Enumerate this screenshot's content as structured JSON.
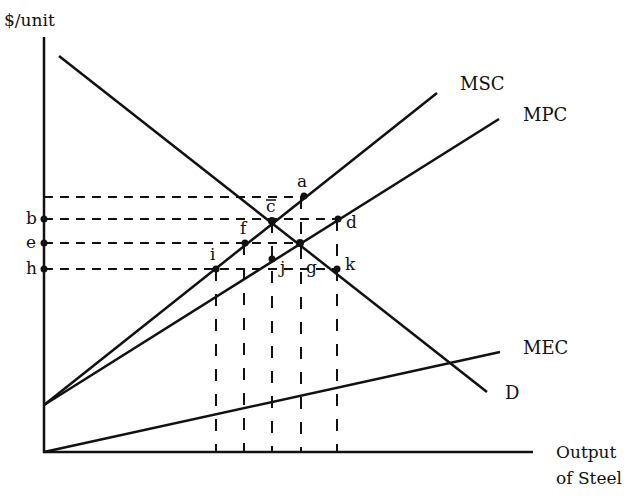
{
  "diagram": {
    "y_axis_label": "$/unit",
    "x_axis_label_line1": "Output",
    "x_axis_label_line2": "of Steel",
    "curves": {
      "msc": "MSC",
      "mpc": "MPC",
      "mec": "MEC",
      "demand": "D"
    },
    "price_labels": {
      "b": "b",
      "e": "e",
      "h": "h"
    },
    "point_labels": {
      "a": "a",
      "c": "c",
      "d": "d",
      "f": "f",
      "g": "g",
      "i": "i",
      "j": "j",
      "k": "k"
    },
    "colors": {
      "ink": "#111111",
      "background": "#ffffff"
    }
  }
}
